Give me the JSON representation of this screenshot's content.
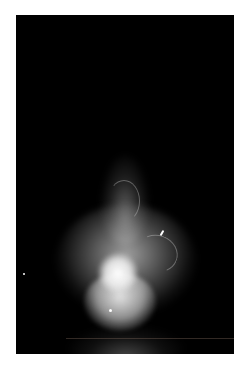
{
  "image": {
    "subject": "glowing smoke plume against black background",
    "alt": "A bright white glowing smoke or vapor shape rising in darkness, bulb-shaped with a narrow neck at top and a bright core near the bottom"
  }
}
